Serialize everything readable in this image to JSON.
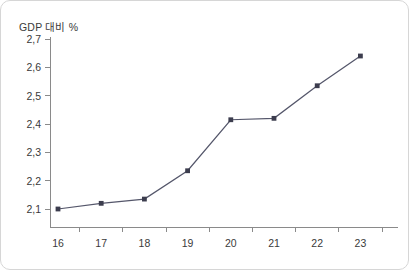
{
  "chart_data": {
    "type": "line",
    "title": "",
    "subtitle": "",
    "ylabel": "GDP 대비 %",
    "xlabel": "",
    "categories": [
      "16",
      "17",
      "18",
      "19",
      "20",
      "21",
      "22",
      "23"
    ],
    "series": [
      {
        "name": "GDP 대비 %",
        "values": [
          2.1,
          2.12,
          2.135,
          2.235,
          2.415,
          2.42,
          2.535,
          2.64
        ],
        "color": "#55576b",
        "marker": "square",
        "marker_color": "#3c3d4e"
      }
    ],
    "y_tick_labels": [
      "2,7",
      "2,6",
      "2,5",
      "2,4",
      "2,3",
      "2,2",
      "2,1"
    ],
    "y_tick_values": [
      2.7,
      2.6,
      2.5,
      2.4,
      2.3,
      2.2,
      2.1
    ],
    "ylim": [
      2.1,
      2.7
    ],
    "xlim": [
      0,
      8
    ],
    "grid": false,
    "legend": false,
    "legend_position": "none",
    "decimal_separator": ",",
    "axis_color": "#8a8a8a",
    "text_color": "#3a3a3a",
    "border_color": "#d6d6d6",
    "background_color": "#ffffff"
  }
}
